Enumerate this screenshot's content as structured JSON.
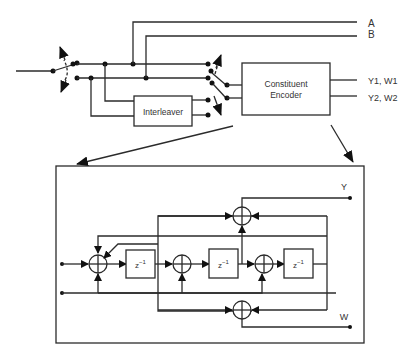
{
  "diagram": {
    "type": "block-diagram",
    "top": {
      "input_switch": "puncturing/selection switch",
      "outputs": {
        "a": "A",
        "b": "B",
        "y1w1": "Y1, W1",
        "y2w2": "Y2, W2"
      },
      "blocks": {
        "interleaver": "Interleaver",
        "encoder_line1": "Constituent",
        "encoder_line2": "Encoder"
      }
    },
    "detail": {
      "delay_label": "z",
      "delay_exp": "−1",
      "outputs": {
        "y": "Y",
        "w": "W"
      },
      "adders": 5,
      "delays": 3
    },
    "colors": {
      "line": "#2b2b2b",
      "background": "#ffffff",
      "text": "#333333"
    }
  }
}
